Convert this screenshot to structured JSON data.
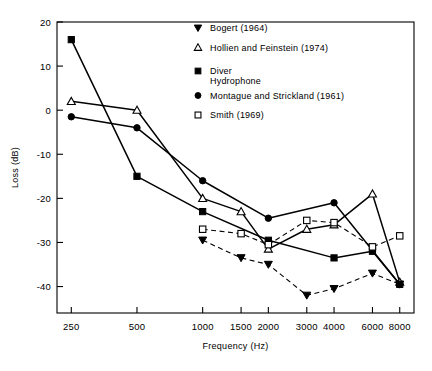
{
  "chart_data": {
    "type": "line",
    "title": "",
    "xlabel": "Frequency (Hz)",
    "ylabel": "Loss (dB)",
    "xscale": "log",
    "x_ticks": [
      250,
      500,
      1000,
      1500,
      2000,
      3000,
      4000,
      6000,
      8000
    ],
    "x_tick_labels": [
      "250",
      "500",
      "1000",
      "1500",
      "2000",
      "3000",
      "4000",
      "6000",
      "8000"
    ],
    "y_ticks": [
      20,
      10,
      0,
      -10,
      -20,
      -30,
      -40
    ],
    "y_tick_labels": [
      "20",
      "10",
      "0",
      "-10",
      "-20",
      "-30",
      "-40"
    ],
    "ylim": [
      -46,
      20
    ],
    "xlim": [
      215,
      9300
    ],
    "grid": false,
    "legend_position": "top-right",
    "series": [
      {
        "name": "Bogert (1964)",
        "marker": "triangle-down-filled",
        "line": "dashed",
        "x": [
          1000,
          1500,
          2000,
          3000,
          4000,
          6000,
          8000
        ],
        "y": [
          -29.5,
          -33.5,
          -35.0,
          -42.0,
          -40.5,
          -37.0,
          -39.5
        ]
      },
      {
        "name": "Hollien and Feinstein (1974)",
        "marker": "triangle-up-open",
        "line": "solid",
        "x": [
          250,
          500,
          1000,
          1500,
          2000,
          3000,
          4000,
          6000,
          8000
        ],
        "y": [
          2.0,
          0.0,
          -20.0,
          -23.0,
          -31.5,
          -27.0,
          -26.0,
          -19.0,
          -39.0
        ]
      },
      {
        "name": "Diver Hydrophone",
        "marker": "square-filled",
        "line": "solid",
        "x": [
          250,
          500,
          1000,
          2000,
          4000,
          6000,
          8000
        ],
        "y": [
          16.0,
          -15.0,
          -23.0,
          -29.5,
          -33.5,
          -32.0,
          -39.5
        ]
      },
      {
        "name": "Montague and Strickland (1961)",
        "marker": "circle-filled",
        "line": "solid",
        "x": [
          250,
          500,
          1000,
          2000,
          4000,
          8000
        ],
        "y": [
          -1.5,
          -4.0,
          -16.0,
          -24.5,
          -21.0,
          -39.5
        ]
      },
      {
        "name": "Smith (1969)",
        "marker": "square-open",
        "line": "dashed",
        "x": [
          1000,
          1500,
          2000,
          3000,
          4000,
          6000,
          8000
        ],
        "y": [
          -27.0,
          -28.0,
          -30.5,
          -25.0,
          -25.5,
          -31.0,
          -28.5
        ]
      }
    ]
  },
  "legend": {
    "items": [
      {
        "label": "Bogert (1964)",
        "marker": "triangle-down-filled"
      },
      {
        "label": "Hollien and Feinstein (1974)",
        "marker": "triangle-up-open"
      },
      {
        "label": "Diver",
        "label2": "Hydrophone",
        "marker": "square-filled"
      },
      {
        "label": "Montague and Strickland (1961)",
        "marker": "circle-filled"
      },
      {
        "label": "Smith (1969)",
        "marker": "square-open"
      }
    ]
  },
  "axes": {
    "x_title": "Frequency (Hz)",
    "y_title": "Loss (dB)",
    "x_labels": [
      "250",
      "500",
      "1000",
      "1500",
      "2000",
      "3000",
      "4000",
      "6000",
      "8000"
    ],
    "y_labels": [
      "20",
      "10",
      "0",
      "-10",
      "-20",
      "-30",
      "-40"
    ]
  }
}
